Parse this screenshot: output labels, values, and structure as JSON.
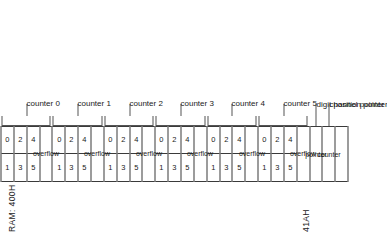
{
  "figure": {
    "start_label": "RAM: 400H",
    "end_label": "41AH"
  },
  "columns": [
    {
      "kind": "pair",
      "top": "1",
      "bottom": "0"
    },
    {
      "kind": "pair",
      "top": "3",
      "bottom": "2"
    },
    {
      "kind": "pair",
      "top": "5",
      "bottom": "4"
    },
    {
      "kind": "wide",
      "label": "overflow"
    },
    {
      "kind": "pair",
      "top": "1",
      "bottom": "0"
    },
    {
      "kind": "pair",
      "top": "3",
      "bottom": "2"
    },
    {
      "kind": "pair",
      "top": "5",
      "bottom": "4"
    },
    {
      "kind": "wide",
      "label": "overflow"
    },
    {
      "kind": "pair",
      "top": "1",
      "bottom": "0"
    },
    {
      "kind": "pair",
      "top": "3",
      "bottom": "2"
    },
    {
      "kind": "pair",
      "top": "5",
      "bottom": "4"
    },
    {
      "kind": "wide",
      "label": "overflow"
    },
    {
      "kind": "pair",
      "top": "1",
      "bottom": "0"
    },
    {
      "kind": "pair",
      "top": "3",
      "bottom": "2"
    },
    {
      "kind": "pair",
      "top": "5",
      "bottom": "4"
    },
    {
      "kind": "wide",
      "label": "overflow"
    },
    {
      "kind": "pair",
      "top": "1",
      "bottom": "0"
    },
    {
      "kind": "pair",
      "top": "3",
      "bottom": "2"
    },
    {
      "kind": "pair",
      "top": "5",
      "bottom": "4"
    },
    {
      "kind": "wide",
      "label": "overflow"
    },
    {
      "kind": "pair",
      "top": "1",
      "bottom": "0"
    },
    {
      "kind": "pair",
      "top": "3",
      "bottom": "2"
    },
    {
      "kind": "pair",
      "top": "5",
      "bottom": "4"
    },
    {
      "kind": "wide",
      "label": "overflow"
    },
    {
      "kind": "wide",
      "label": "pointer"
    },
    {
      "kind": "wide",
      "label": "counter"
    },
    {
      "kind": "blank",
      "label": ""
    }
  ],
  "groups": [
    {
      "label": "counter 0",
      "start": 0,
      "span": 4
    },
    {
      "label": "counter 1",
      "start": 4,
      "span": 4
    },
    {
      "label": "counter 2",
      "start": 8,
      "span": 4
    },
    {
      "label": "counter 3",
      "start": 12,
      "span": 4
    },
    {
      "label": "counter 4",
      "start": 16,
      "span": 4
    },
    {
      "label": "counter 5",
      "start": 20,
      "span": 4
    }
  ],
  "pointers": [
    {
      "label": "digit position pointer",
      "index": 24
    },
    {
      "label": "channel pointer",
      "index": 25
    }
  ],
  "colors": {
    "line": "#3a3a3a",
    "text": "#1a1a1a",
    "background": "#ffffff"
  }
}
